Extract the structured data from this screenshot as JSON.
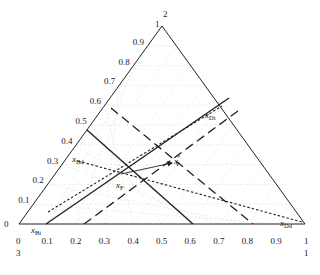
{
  "vertices": {
    "top": "1",
    "top_index": "2",
    "bottom_left": "0",
    "bottom_left_index": "3",
    "bottom_right": "1",
    "bottom_right_index": "1"
  },
  "left_axis_ticks": [
    "0",
    "0.1",
    "0.2",
    "0.3",
    "0.4",
    "0.5",
    "0.6",
    "0.7",
    "0.8",
    "0.9"
  ],
  "bottom_axis_ticks": [
    "0.1",
    "0.2",
    "0.3",
    "0.4",
    "0.5",
    "0.6",
    "0.7",
    "0.8",
    "0.9"
  ],
  "points": {
    "xF": {
      "label": "x",
      "sub": "F"
    },
    "xF_star": {
      "label": "x",
      "sub": "F",
      "sup": "*"
    },
    "xBi": {
      "label": "x",
      "sub": "Bi"
    },
    "xDi": {
      "label": "x",
      "sub": "Di"
    },
    "xBd": {
      "label": "x",
      "sub": "Bd"
    },
    "xDd": {
      "label": "x",
      "sub": "Dd"
    }
  },
  "colors": {
    "line": "#222222",
    "grid": "#d8d8d8"
  }
}
